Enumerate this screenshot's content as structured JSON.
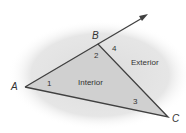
{
  "diagram": {
    "vertices": {
      "A": "A",
      "B": "B",
      "C": "C"
    },
    "angles": {
      "a1": "1",
      "a2": "2",
      "a3": "3",
      "a4": "4"
    },
    "regions": {
      "interior": "Interior",
      "exterior": "Exterior"
    },
    "colors": {
      "background_blob": "#e3e3e3",
      "triangle_fill": "#d4d4d4",
      "line": "#404040"
    }
  }
}
